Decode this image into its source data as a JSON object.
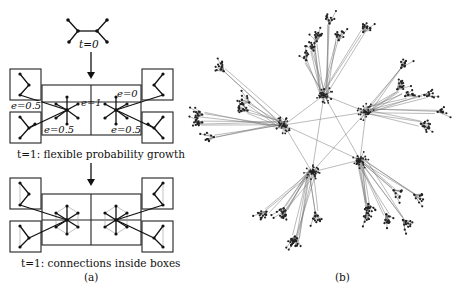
{
  "panel_a": {
    "label_t0": "t=0",
    "label_e_left_top": "e=0.5",
    "label_e_center": "e=1",
    "label_e_right_top": "e=0",
    "label_e_left_bottom": "e=0.5",
    "label_e_right_bottom": "e=0.5",
    "caption_step1": "t=1: flexible probability growth",
    "caption_step2": "t=1: connections inside boxes",
    "subfigure_label": "(a)"
  },
  "panel_b": {
    "subfigure_label": "(b)",
    "hubs": [
      {
        "name": "top",
        "x": 324,
        "y": 95
      },
      {
        "name": "right",
        "x": 366,
        "y": 112
      },
      {
        "name": "left",
        "x": 284,
        "y": 125
      },
      {
        "name": "bottom-left",
        "x": 312,
        "y": 172
      },
      {
        "name": "bottom-right",
        "x": 360,
        "y": 160
      }
    ]
  },
  "colors": {
    "ink": "#111111",
    "network_edge": "#777777",
    "background": "#ffffff"
  }
}
